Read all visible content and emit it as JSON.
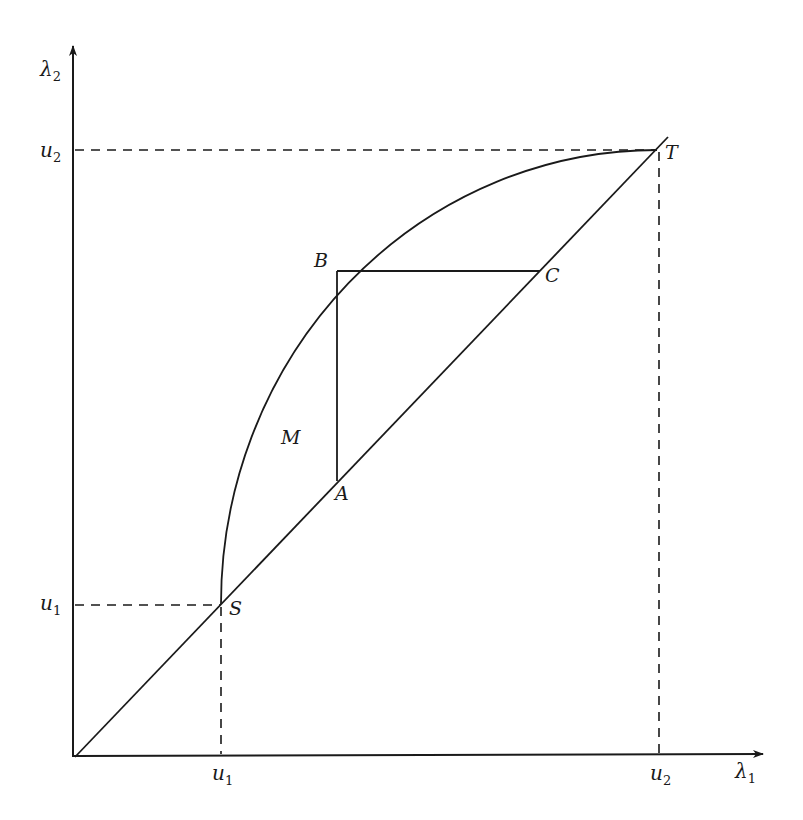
{
  "diagram": {
    "type": "phase-plane geometric construction",
    "axes": {
      "x_label": "λ",
      "x_label_sub": "1",
      "y_label": "λ",
      "y_label_sub": "2"
    },
    "ticks": {
      "x": [
        {
          "label": "u",
          "sub": "1"
        },
        {
          "label": "u",
          "sub": "2"
        }
      ],
      "y": [
        {
          "label": "u",
          "sub": "1"
        },
        {
          "label": "u",
          "sub": "2"
        }
      ]
    },
    "points": {
      "S": "S",
      "T": "T",
      "A": "A",
      "B": "B",
      "C": "C"
    },
    "region_label": "M",
    "colors": {
      "ink": "#1a1a1a",
      "background": "#ffffff"
    }
  }
}
